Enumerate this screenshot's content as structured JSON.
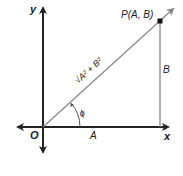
{
  "diagram": {
    "axis_x_label": "x",
    "axis_y_label": "y",
    "origin_label": "O",
    "point_label": "P(A, B)",
    "horizontal_side_label": "A",
    "vertical_side_label": "B",
    "hypotenuse_label": "√A² + B²",
    "angle_label": "ϕ",
    "colors": {
      "axes": "#222222",
      "vector": "#8a8a8a",
      "point": "#111111"
    }
  }
}
